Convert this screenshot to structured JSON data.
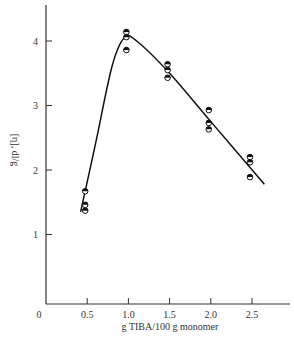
{
  "chart_data": {
    "type": "scatter",
    "title": "",
    "xlabel": "g TIBA/100 g monomer",
    "ylabel": "[η], dl/g",
    "xlim": [
      0,
      2.8
    ],
    "ylim": [
      0,
      4.5
    ],
    "x_ticks": [
      "0",
      "0.5",
      "1.0",
      "1.5",
      "2.0",
      "2.5"
    ],
    "y_ticks": [
      "1",
      "2",
      "3",
      "4"
    ],
    "grid": false,
    "legend": null,
    "series": [
      {
        "name": "measured",
        "marker": "half-filled circle",
        "points": [
          {
            "x": 0.5,
            "y": 1.67
          },
          {
            "x": 0.5,
            "y": 1.46
          },
          {
            "x": 0.5,
            "y": 1.37
          },
          {
            "x": 1.0,
            "y": 4.14
          },
          {
            "x": 1.0,
            "y": 4.06
          },
          {
            "x": 1.0,
            "y": 3.86
          },
          {
            "x": 1.5,
            "y": 3.64
          },
          {
            "x": 1.5,
            "y": 3.55
          },
          {
            "x": 1.5,
            "y": 3.43
          },
          {
            "x": 2.0,
            "y": 2.93
          },
          {
            "x": 2.0,
            "y": 2.73
          },
          {
            "x": 2.0,
            "y": 2.63
          },
          {
            "x": 2.5,
            "y": 2.2
          },
          {
            "x": 2.5,
            "y": 2.12
          },
          {
            "x": 2.5,
            "y": 1.89
          }
        ]
      },
      {
        "name": "fitted curve",
        "type": "line",
        "points": [
          {
            "x": 0.42,
            "y": 1.35
          },
          {
            "x": 0.6,
            "y": 2.4
          },
          {
            "x": 0.8,
            "y": 3.6
          },
          {
            "x": 0.95,
            "y": 4.05
          },
          {
            "x": 1.1,
            "y": 4.0
          },
          {
            "x": 1.5,
            "y": 3.5
          },
          {
            "x": 2.0,
            "y": 2.75
          },
          {
            "x": 2.65,
            "y": 1.78
          }
        ]
      }
    ]
  }
}
